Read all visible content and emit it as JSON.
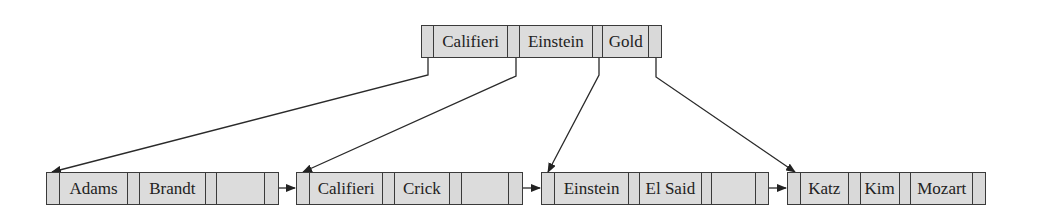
{
  "diagram": {
    "type": "B+ tree",
    "colors": {
      "cell_fill": "#d9d9d9",
      "stroke": "#3a3a3a",
      "text": "#222222",
      "background": "#ffffff"
    },
    "root": {
      "keys": [
        "Califieri",
        "Einstein",
        "Gold"
      ]
    },
    "leaves": [
      {
        "keys": [
          "Adams",
          "Brandt",
          ""
        ]
      },
      {
        "keys": [
          "Califieri",
          "Crick",
          ""
        ]
      },
      {
        "keys": [
          "Einstein",
          "El Said",
          ""
        ]
      },
      {
        "keys": [
          "Katz",
          "Kim",
          "Mozart"
        ]
      }
    ]
  }
}
